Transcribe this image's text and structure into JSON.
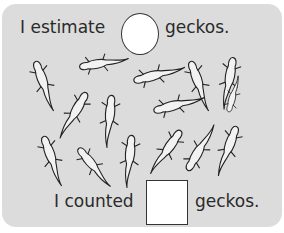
{
  "worksheet": {
    "estimate_prefix": "I estimate",
    "estimate_suffix": "geckos.",
    "counted_prefix": "I counted",
    "counted_suffix": "geckos.",
    "estimate_answer": "",
    "counted_answer": ""
  },
  "illustration": {
    "subject": "gecko",
    "count": 15
  },
  "colors": {
    "card_background": "#dcdcdc",
    "text": "#2a2a2a",
    "answer_box": "#ffffff"
  }
}
